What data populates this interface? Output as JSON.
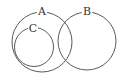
{
  "diagram": {
    "type": "venn",
    "sets": [
      {
        "id": "A",
        "label": "A",
        "cx": 42,
        "cy": 42,
        "r": 30
      },
      {
        "id": "B",
        "label": "B",
        "cx": 87,
        "cy": 41,
        "r": 29
      },
      {
        "id": "C",
        "label": "C",
        "cx": 34,
        "cy": 47,
        "r": 19.5
      }
    ],
    "relations": [
      "C is a subset of A",
      "A and B overlap",
      "C and B do not overlap"
    ],
    "labels": {
      "a": "A",
      "b": "B",
      "c": "C"
    },
    "colors": {
      "stroke": "#5a5a5a",
      "text": "#333333",
      "background": "#ffffff"
    }
  }
}
